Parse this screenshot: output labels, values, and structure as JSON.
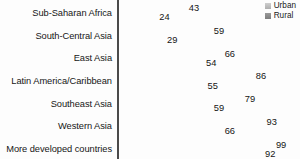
{
  "chart_data": {
    "type": "bar",
    "orientation": "horizontal",
    "title": "",
    "xlabel": "",
    "ylabel": "",
    "xlim": [
      0,
      100
    ],
    "grid": false,
    "legend_position": "top-right",
    "categories": [
      "Sub-Saharan Africa",
      "South-Central Asia",
      "East Asia",
      "Latin America/Caribbean",
      "Southeast Asia",
      "Western Asia",
      "More developed countries"
    ],
    "series": [
      {
        "name": "Urban",
        "color": "#b8b8b8",
        "values": [
          43,
          59,
          66,
          86,
          79,
          93,
          99
        ]
      },
      {
        "name": "Rural",
        "color": "#888888",
        "values": [
          24,
          29,
          54,
          55,
          59,
          66,
          92
        ]
      }
    ]
  },
  "legend": {
    "items": [
      {
        "label": "Urban",
        "swatch": "urban"
      },
      {
        "label": "Rural",
        "swatch": "rural"
      }
    ]
  }
}
